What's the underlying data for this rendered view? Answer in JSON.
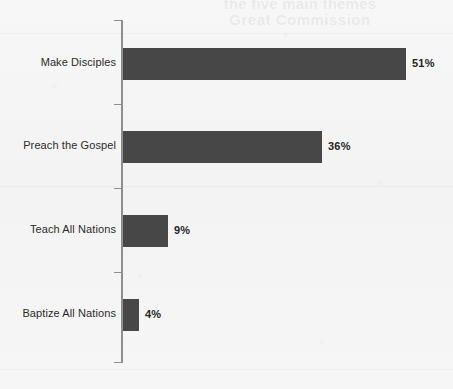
{
  "page": {
    "background_color": "#f5f5f5",
    "bleed_through_line_1": "the five main themes",
    "bleed_through_line_2": "Great Commission"
  },
  "chart_data": {
    "type": "bar",
    "orientation": "horizontal",
    "title": "",
    "subtitle": "",
    "xlabel": "",
    "ylabel": "",
    "categories": [
      "Make Disciples",
      "Preach the Gospel",
      "Teach All Nations",
      "Baptize All Nations"
    ],
    "values": [
      51,
      36,
      9,
      4
    ],
    "value_labels": [
      "51%",
      "36%",
      "9%",
      "4%"
    ],
    "xlim": [
      0,
      55
    ],
    "grid": false,
    "legend": false,
    "bar_color": "#474747",
    "axis_color": "#8e8e8e",
    "label_color": "#2b2b2b",
    "value_label_color": "#262626"
  },
  "bars": [
    {
      "label": "Make Disciples",
      "value": 51,
      "value_label": "51%",
      "bar_px": 283,
      "top_px": 48
    },
    {
      "label": "Preach the Gospel",
      "value": 36,
      "value_label": "36%",
      "bar_px": 199,
      "top_px": 131
    },
    {
      "label": "Teach All Nations",
      "value": 9,
      "value_label": "9%",
      "bar_px": 45,
      "top_px": 215
    },
    {
      "label": "Baptize All Nations",
      "value": 4,
      "value_label": "4%",
      "bar_px": 16,
      "top_px": 299
    }
  ],
  "axis": {
    "ticks": [
      {
        "top_px": 20
      },
      {
        "top_px": 104
      },
      {
        "top_px": 188
      },
      {
        "top_px": 272
      },
      {
        "top_px": 362
      }
    ]
  }
}
